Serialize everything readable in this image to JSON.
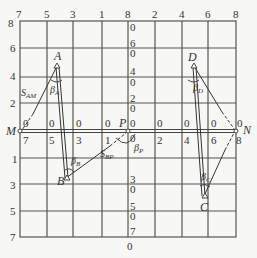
{
  "diagram": {
    "colors": {
      "background": "#f7f7f5",
      "grid": "#555555",
      "lines": "#333333",
      "text": "#333333"
    },
    "top_ticks": [
      "7",
      "5",
      "3",
      "1",
      "8",
      "2",
      "4",
      "6",
      "8"
    ],
    "left_ticks_upper": [
      "8",
      "6",
      "4",
      "2"
    ],
    "left_ticks_lower": [
      "1",
      "3",
      "5",
      "7"
    ],
    "center_ticks_upper": [
      {
        "top": "0",
        "bottom": ""
      },
      {
        "top": "6",
        "bottom": "0"
      },
      {
        "top": "4",
        "bottom": "0"
      },
      {
        "top": "2",
        "bottom": "0"
      }
    ],
    "center_ticks_lower": [
      {
        "top": "3",
        "bottom": "0"
      },
      {
        "top": "5",
        "bottom": "0"
      },
      {
        "top": "7",
        "bottom": "0"
      }
    ],
    "axis_upper_zeros": [
      "0",
      "0",
      "0",
      "0",
      "0",
      "0",
      "0",
      "0",
      "0"
    ],
    "axis_lower_labels": [
      "7",
      "5",
      "3",
      "1",
      "0",
      "2",
      "4",
      "6",
      "8"
    ],
    "points": {
      "M": "M",
      "N": "N",
      "P": "P",
      "A": "A",
      "B": "B",
      "C": "C",
      "D": "D"
    },
    "annotations": {
      "S_AM": {
        "main": "S",
        "sub": "AM"
      },
      "S_BP": {
        "main": "S",
        "sub": "BP"
      },
      "beta_A": {
        "main": "β",
        "sub": "A"
      },
      "beta_B": {
        "main": "β",
        "sub": "B"
      },
      "beta_C": {
        "main": "β",
        "sub": "C"
      },
      "beta_D": {
        "main": "β",
        "sub": "D"
      },
      "beta_P": {
        "main": "β",
        "sub": "P"
      }
    }
  }
}
